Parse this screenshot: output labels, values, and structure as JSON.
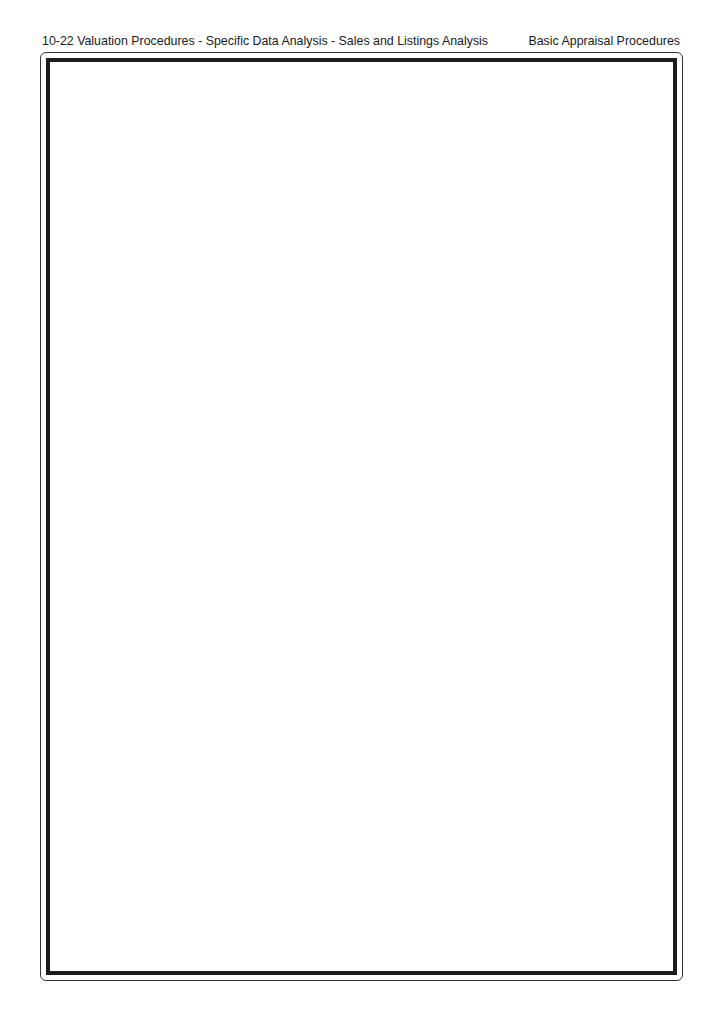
{
  "page_header": {
    "left": "10-22 Valuation Procedures - Specific Data Analysis - Sales and Listings Analysis",
    "right": "Basic Appraisal Procedures"
  },
  "content_frame": {
    "content": ""
  }
}
